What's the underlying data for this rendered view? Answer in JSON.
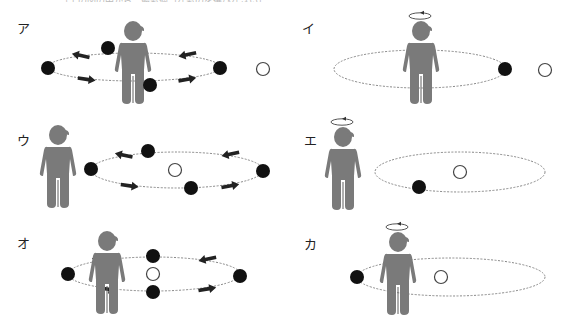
{
  "header": {
    "cut_text": "（上の図の中から、最も適当なものを選びなさい）"
  },
  "panels": [
    {
      "id": "a",
      "label": "ア",
      "person_x": 133,
      "person_top": 22,
      "halo": false,
      "orbit": {
        "cx": 134,
        "cy": 67,
        "rx": 86,
        "ry": 14,
        "arrows": true
      },
      "dots": [
        [
          48,
          68
        ],
        [
          108,
          48
        ],
        [
          150,
          85
        ],
        [
          220,
          68
        ]
      ],
      "open": [
        263,
        69
      ],
      "label_pos": [
        17,
        18
      ]
    },
    {
      "id": "i",
      "label": "イ",
      "person_x": 421,
      "person_top": 22,
      "halo": true,
      "orbit": {
        "cx": 420,
        "cy": 69,
        "rx": 86,
        "ry": 19,
        "arrows": false
      },
      "dots": [
        [
          505,
          69
        ]
      ],
      "open": [
        545,
        70
      ],
      "label_pos": [
        302,
        18
      ]
    },
    {
      "id": "u",
      "label": "ウ",
      "person_x": 58,
      "person_top": 126,
      "halo": false,
      "orbit": {
        "cx": 177,
        "cy": 170,
        "rx": 86,
        "ry": 18,
        "arrows": true
      },
      "dots": [
        [
          91,
          169
        ],
        [
          148,
          151
        ],
        [
          191,
          188
        ],
        [
          263,
          171
        ]
      ],
      "open": [
        175,
        170
      ],
      "label_pos": [
        17,
        130
      ]
    },
    {
      "id": "e",
      "label": "エ",
      "person_x": 343,
      "person_top": 128,
      "halo": true,
      "orbit": {
        "cx": 460,
        "cy": 172,
        "rx": 85,
        "ry": 20,
        "arrows": false
      },
      "dots": [
        [
          419,
          187
        ]
      ],
      "open": [
        460,
        172
      ],
      "label_pos": [
        304,
        130
      ]
    },
    {
      "id": "o",
      "label": "オ",
      "person_x": 107,
      "person_top": 232,
      "halo": false,
      "orbit": {
        "cx": 154,
        "cy": 274,
        "rx": 86,
        "ry": 17,
        "arrows": true
      },
      "dots": [
        [
          68,
          274
        ],
        [
          153,
          256
        ],
        [
          153,
          292
        ],
        [
          240,
          276
        ]
      ],
      "open": [
        153,
        274
      ],
      "label_pos": [
        17,
        233
      ]
    },
    {
      "id": "ka",
      "label": "カ",
      "person_x": 398,
      "person_top": 233,
      "halo": true,
      "orbit": {
        "cx": 451,
        "cy": 277,
        "rx": 94,
        "ry": 19,
        "arrows": false
      },
      "dots": [
        [
          357,
          277
        ]
      ],
      "open": [
        441,
        277
      ],
      "label_pos": [
        304,
        234
      ]
    }
  ],
  "colors": {
    "person": "#7a7a7a",
    "dot": "#111111",
    "orbit": "#888888",
    "open_stroke": "#444444"
  }
}
